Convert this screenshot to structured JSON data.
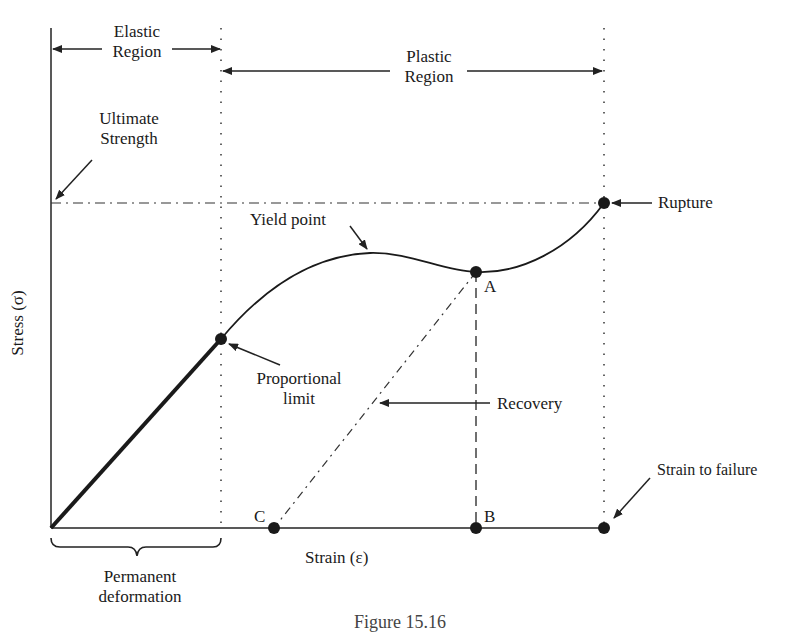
{
  "diagram": {
    "axes": {
      "y_label": "Stress (σ)",
      "x_label": "Strain (ε)"
    },
    "regions": {
      "elastic": [
        "Elastic",
        "Region"
      ],
      "plastic": [
        "Plastic",
        "Region"
      ]
    },
    "annotations": {
      "ultimate_strength": [
        "Ultimate",
        "Strength"
      ],
      "rupture": "Rupture",
      "yield_point": "Yield point",
      "proportional_limit": [
        "Proportional",
        "limit"
      ],
      "recovery": "Recovery",
      "strain_to_failure": "Strain to failure",
      "permanent_deformation": [
        "Permanent",
        "deformation"
      ]
    },
    "points": {
      "A": "A",
      "B": "B",
      "C": "C"
    },
    "caption": "Figure 15.16"
  }
}
